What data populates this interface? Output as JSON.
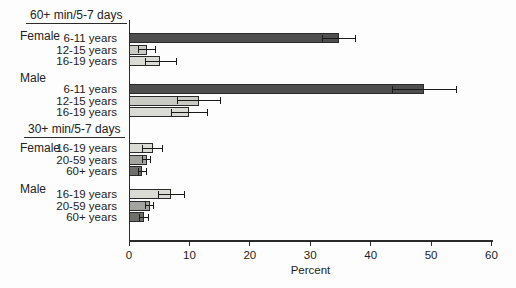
{
  "chart_data": {
    "type": "bar",
    "orientation": "horizontal",
    "xlabel": "Percent",
    "x_ticks": [
      0,
      10,
      20,
      30,
      40,
      50,
      60
    ],
    "xlim": [
      0,
      60
    ],
    "grid": false,
    "legend": "none",
    "error_bars": "95% confidence interval whiskers with end caps",
    "age_colors": {
      "6-11 years": "#4e4e4e",
      "12-15 years": "#c9cbc4",
      "16-19 years": "#dadbd5",
      "20-59 years": "#a3a49f",
      "60+ years": "#6e6f6a"
    },
    "axis_color": "#2b2b2b",
    "groups": [
      {
        "heading": "60+ min/5-7 days",
        "subgroups": [
          {
            "label": "Female",
            "bars": [
              {
                "category": "6-11 years",
                "value": 34.7,
                "ci_low": 31.9,
                "ci_high": 37.5
              },
              {
                "category": "12-15 years",
                "value": 3.0,
                "ci_low": 1.5,
                "ci_high": 4.5
              },
              {
                "category": "16-19 years",
                "value": 5.2,
                "ci_low": 2.7,
                "ci_high": 7.9
              }
            ]
          },
          {
            "label": "Male",
            "bars": [
              {
                "category": "6-11 years",
                "value": 48.9,
                "ci_low": 43.5,
                "ci_high": 54.3
              },
              {
                "category": "12-15 years",
                "value": 11.6,
                "ci_low": 8.0,
                "ci_high": 15.2
              },
              {
                "category": "16-19 years",
                "value": 10.0,
                "ci_low": 6.9,
                "ci_high": 13.1
              }
            ]
          }
        ]
      },
      {
        "heading": "30+ min/5-7 days",
        "subgroups": [
          {
            "label": "Female",
            "bars": [
              {
                "category": "16-19 years",
                "value": 3.9,
                "ci_low": 2.1,
                "ci_high": 5.7
              },
              {
                "category": "20-59 years",
                "value": 2.9,
                "ci_low": 2.1,
                "ci_high": 3.7
              },
              {
                "category": "60+ years",
                "value": 2.2,
                "ci_low": 1.5,
                "ci_high": 2.9
              }
            ]
          },
          {
            "label": "Male",
            "bars": [
              {
                "category": "16-19 years",
                "value": 7.0,
                "ci_low": 4.8,
                "ci_high": 9.2
              },
              {
                "category": "20-59 years",
                "value": 3.4,
                "ci_low": 2.6,
                "ci_high": 4.2
              },
              {
                "category": "60+ years",
                "value": 2.5,
                "ci_low": 1.7,
                "ci_high": 3.3
              }
            ]
          }
        ]
      }
    ]
  }
}
